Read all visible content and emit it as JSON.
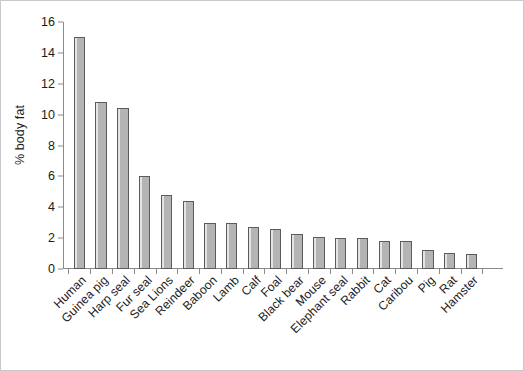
{
  "chart_data": {
    "type": "bar",
    "title": "",
    "xlabel": "",
    "ylabel": "% body fat",
    "ylim": [
      0,
      16
    ],
    "yticks": [
      0,
      2,
      4,
      6,
      8,
      10,
      12,
      14,
      16
    ],
    "grid": false,
    "legend": false,
    "categories": [
      "Human",
      "Guinea pig",
      "Harp seal",
      "Fur seal",
      "Sea Lions",
      "Reindeer",
      "Baboon",
      "Lamb",
      "Calf",
      "Foal",
      "Black bear",
      "Mouse",
      "Elephant seal",
      "Rabbit",
      "Cat",
      "Caribou",
      "Pig",
      "Rat",
      "Hamster"
    ],
    "values": [
      15.0,
      10.8,
      10.4,
      6.0,
      4.8,
      4.4,
      3.0,
      3.0,
      2.75,
      2.6,
      2.3,
      2.1,
      2.0,
      2.0,
      1.8,
      1.8,
      1.25,
      1.05,
      1.0
    ],
    "bar_fill_color": "#b4b4b4",
    "bar_edge_color": "#5b5b5b",
    "axis_color": "#8a8a8a",
    "text_color": "#1b1b1b",
    "background_color": "#ffffff"
  }
}
